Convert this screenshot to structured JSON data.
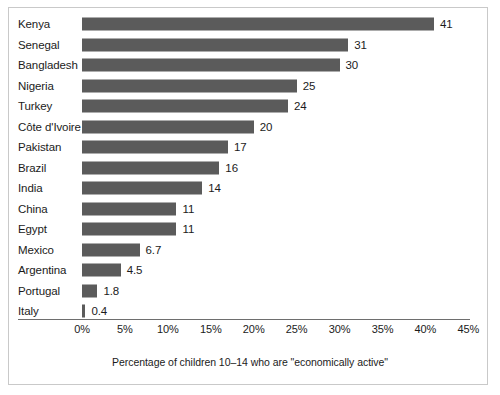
{
  "chart_data": {
    "type": "bar",
    "orientation": "horizontal",
    "title": "",
    "subtitle": "",
    "xlabel": "Percentage of children 10–14 who are \"economically active\"",
    "ylabel": "",
    "categories": [
      "Kenya",
      "Senegal",
      "Bangladesh",
      "Nigeria",
      "Turkey",
      "Côte d'Ivoire",
      "Pakistan",
      "Brazil",
      "India",
      "China",
      "Egypt",
      "Mexico",
      "Argentina",
      "Portugal",
      "Italy"
    ],
    "values": [
      41,
      31,
      30,
      25,
      24,
      20,
      17,
      16,
      14,
      11,
      11,
      6.7,
      4.5,
      1.8,
      0.4
    ],
    "value_labels": [
      "41",
      "31",
      "30",
      "25",
      "24",
      "20",
      "17",
      "16",
      "14",
      "11",
      "11",
      "6.7",
      "4.5",
      "1.8",
      "0.4"
    ],
    "xlim": [
      0,
      45
    ],
    "xticks": [
      0,
      5,
      10,
      15,
      20,
      25,
      30,
      35,
      40,
      45
    ],
    "xtick_labels": [
      "0%",
      "5%",
      "10%",
      "15%",
      "20%",
      "25%",
      "30%",
      "35%",
      "40%",
      "45%"
    ],
    "grid": false,
    "legend": null,
    "bar_color": "#5b5b5b",
    "axis_color": "#6e6e6e",
    "text_color": "#1b1b1b",
    "background_color": "#ffffff"
  },
  "axis": {
    "caption": "Percentage of children 10–14 who are \"economically active\""
  }
}
